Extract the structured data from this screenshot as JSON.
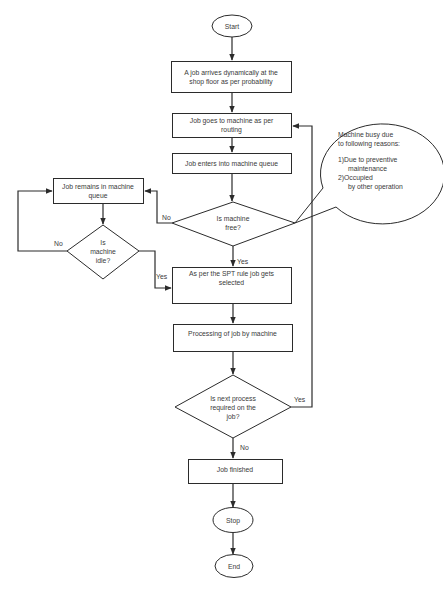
{
  "diagram": {
    "type": "flowchart",
    "line_color": "#2b2b2b",
    "fill_color": "#ffffff",
    "text_color": "#3a3a3a"
  },
  "nodes": {
    "start": {
      "label": "Start"
    },
    "job_arrives": {
      "lines": [
        "A job arrives dynamically at the",
        "shop floor as per probability"
      ]
    },
    "goes_to_machine": {
      "lines": [
        "Job goes to machine as per",
        "routing"
      ]
    },
    "enters_queue": {
      "lines": [
        "Job enters into machine queue"
      ]
    },
    "machine_free": {
      "lines": [
        "Is machine",
        "free?"
      ]
    },
    "remains_in_queue": {
      "lines": [
        "Job remains in machine",
        "queue"
      ]
    },
    "machine_idle": {
      "lines": [
        "Is",
        "machine",
        "idle?"
      ]
    },
    "spt_selected": {
      "lines": [
        "As per the SPT rule job gets",
        "selected"
      ]
    },
    "processing": {
      "lines": [
        "Processing of job by machine"
      ]
    },
    "next_process": {
      "lines": [
        "Is next process",
        "required on the",
        "job?"
      ]
    },
    "job_finished": {
      "lines": [
        "Job finished"
      ]
    },
    "stop": {
      "label": "Stop"
    },
    "end": {
      "label": "End"
    }
  },
  "edge_labels": {
    "free_no": "No",
    "free_yes": "Yes",
    "idle_no": "No",
    "idle_yes": "Yes",
    "next_yes": "Yes",
    "next_no": "No"
  },
  "callout": {
    "title_lines": [
      "Machine busy due",
      "to following reasons:"
    ],
    "reasons": [
      {
        "num": "1)",
        "lines": [
          "Due to preventive",
          "maintenance"
        ]
      },
      {
        "num": "2)",
        "lines": [
          "Occupied",
          "by other operation"
        ]
      }
    ]
  }
}
